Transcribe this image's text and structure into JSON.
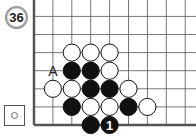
{
  "problem": {
    "number": "36"
  },
  "to_play": {
    "color": "white",
    "icon": "white-stone-icon"
  },
  "board": {
    "origin_x": 34,
    "origin_y": 125,
    "spacing_x": 18.9,
    "spacing_y": 18.1,
    "cols": 9,
    "rows": 7,
    "edges": [
      "left",
      "bottom"
    ],
    "stones": [
      {
        "color": "white",
        "col": 2,
        "row": 4
      },
      {
        "color": "white",
        "col": 3,
        "row": 4
      },
      {
        "color": "white",
        "col": 4,
        "row": 4
      },
      {
        "color": "black",
        "col": 2,
        "row": 3
      },
      {
        "color": "black",
        "col": 3,
        "row": 3
      },
      {
        "color": "white",
        "col": 4,
        "row": 3
      },
      {
        "color": "white",
        "col": 1,
        "row": 2
      },
      {
        "color": "white",
        "col": 2,
        "row": 2
      },
      {
        "color": "black",
        "col": 3,
        "row": 2
      },
      {
        "color": "black",
        "col": 4,
        "row": 2
      },
      {
        "color": "white",
        "col": 5,
        "row": 2
      },
      {
        "color": "black",
        "col": 2,
        "row": 1
      },
      {
        "color": "white",
        "col": 3,
        "row": 1
      },
      {
        "color": "white",
        "col": 4,
        "row": 1
      },
      {
        "color": "black",
        "col": 5,
        "row": 1
      },
      {
        "color": "white",
        "col": 6,
        "row": 1
      },
      {
        "color": "black",
        "col": 3,
        "row": 0
      },
      {
        "color": "black",
        "col": 4,
        "row": 0,
        "label": "1"
      }
    ],
    "markers": [
      {
        "label": "A",
        "col": 1,
        "row": 3
      }
    ]
  }
}
